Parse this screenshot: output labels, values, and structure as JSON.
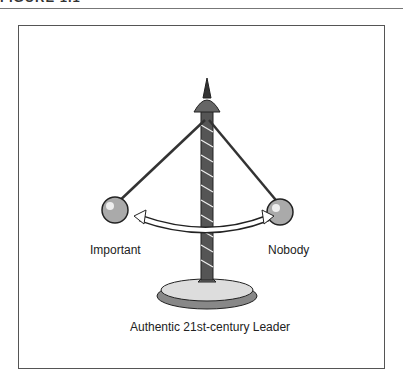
{
  "figure": {
    "heading": "FIGURE 1.1",
    "caption": "Authentic 21st-century Leader",
    "left_label": "Important",
    "right_label": "Nobody",
    "illustration": "balance-pendulum-icon"
  },
  "colors": {
    "ink": "#222222",
    "frame": "#555555",
    "rule": "#777777"
  }
}
